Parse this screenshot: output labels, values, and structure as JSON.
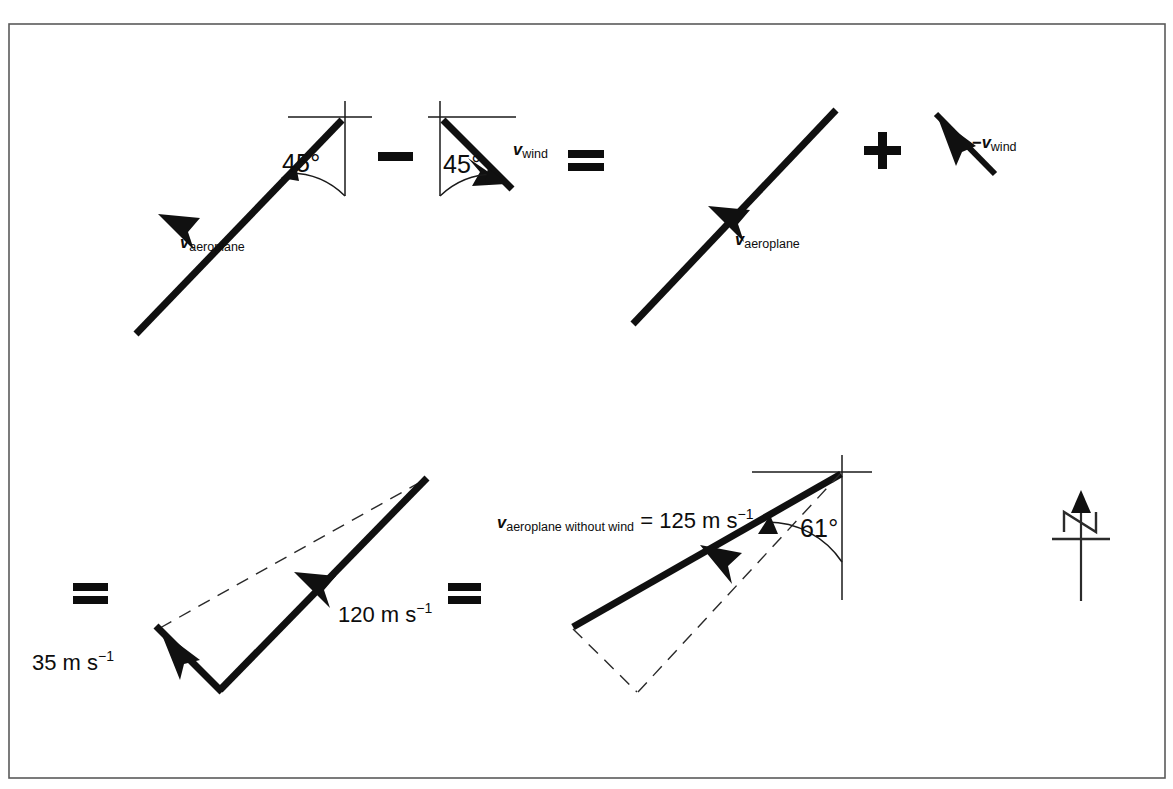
{
  "figure": {
    "kind": "vector-diagram",
    "title_visible": false,
    "background_color": "#ffffff",
    "ink_color": "#101010",
    "frame": {
      "color": "#5a5a5a",
      "x": 9,
      "y": 24,
      "width": 1156,
      "height": 754
    }
  },
  "row_top": {
    "term1": {
      "name": "v-aeroplane-with-wind",
      "symbol": "v",
      "subscript": "aeroplane",
      "angle_label": "45°",
      "angle_from": "north",
      "direction": "south-west"
    },
    "operator1": {
      "glyph": "minus",
      "label": "−"
    },
    "term2": {
      "name": "v-wind",
      "symbol": "v",
      "subscript": "wind",
      "angle_label": "45°",
      "angle_from": "north",
      "direction": "south-east"
    },
    "operator2": {
      "glyph": "equals",
      "label": "="
    },
    "term3": {
      "name": "v-aeroplane-with-wind-copy",
      "symbol": "v",
      "subscript": "aeroplane",
      "direction": "south-west"
    },
    "operator3": {
      "glyph": "plus",
      "label": "+"
    },
    "term4": {
      "name": "minus-v-wind",
      "sign": "−",
      "symbol": "v",
      "subscript": "wind",
      "direction": "north-west"
    }
  },
  "row_bottom": {
    "operator1": {
      "glyph": "equals",
      "label": "="
    },
    "triangle_left": {
      "name": "velocity-triangle",
      "vector_long": {
        "label_value": "120",
        "label_unit": "m s",
        "label_exponent": "−1",
        "full_label": "120 m s⁻¹"
      },
      "vector_short": {
        "label_value": "35",
        "label_unit": "m s",
        "label_exponent": "−1",
        "full_label": "35 m s⁻¹"
      },
      "closing_side": {
        "style": "dashed"
      }
    },
    "operator2": {
      "glyph": "equals",
      "label": "="
    },
    "triangle_right": {
      "name": "resultant-triangle",
      "resultant": {
        "symbol": "v",
        "subscript": "aeroplane without wind",
        "equals": "=",
        "label_value": "125",
        "label_unit": "m s",
        "label_exponent": "−1",
        "full_label": "v aeroplane without wind = 125 m s⁻¹"
      },
      "angle_label": "61°",
      "angle_from": "north",
      "dashed_sides": 2
    }
  },
  "compass": {
    "name": "north-indicator",
    "letter": "N",
    "points_to": "up"
  }
}
